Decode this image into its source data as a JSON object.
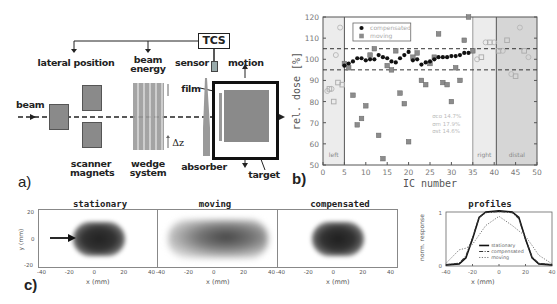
{
  "panel_a": {
    "label": "a)",
    "tcs": "TCS",
    "lateral_position": "lateral position",
    "beam_energy": [
      "beam",
      "energy"
    ],
    "sensor": "sensor",
    "motion": "motion",
    "beam": "beam",
    "film": "film",
    "delta_z": "Δz",
    "scanner_magnets": [
      "scanner",
      "magnets"
    ],
    "wedge_system": [
      "wedge",
      "system"
    ],
    "absorber": "absorber",
    "target": "target"
  },
  "chart_data": [
    {
      "panel": "b)",
      "type": "scatter",
      "title": "",
      "xlabel": "IC number",
      "ylabel": "rel. dose [%]",
      "xlim": [
        0,
        50
      ],
      "ylim": [
        50,
        120
      ],
      "xticks": [
        0,
        5,
        10,
        15,
        20,
        25,
        30,
        35,
        40,
        45,
        50
      ],
      "yticks": [
        50,
        60,
        70,
        80,
        90,
        100,
        110,
        120
      ],
      "reference_lines": [
        105,
        95
      ],
      "regions": [
        {
          "label": "left",
          "x": [
            0,
            5
          ],
          "shade": "light"
        },
        {
          "label": "right",
          "x": [
            35,
            40
          ],
          "shade": "light"
        },
        {
          "label": "distal",
          "x": [
            40.5,
            50
          ],
          "shade": "medium"
        }
      ],
      "legend": [
        "compensated",
        "moving"
      ],
      "legend_position": "upper left (inside)",
      "annotation": [
        "σco 14.7%",
        "σm 17.9%",
        "σst 14.6%"
      ],
      "series": [
        {
          "name": "compensated",
          "marker": "filled circle",
          "color": "#111111",
          "x": [
            5,
            6,
            7,
            8,
            9,
            10,
            11,
            12,
            13,
            14,
            15,
            16,
            17,
            18,
            19,
            20,
            21,
            22,
            23,
            24,
            25,
            26,
            27,
            28,
            29,
            30,
            31,
            32,
            33,
            34
          ],
          "y": [
            97,
            98,
            99,
            100.5,
            100.5,
            99.5,
            100,
            100,
            102,
            101,
            100.5,
            99,
            98.5,
            100.5,
            102,
            103.5,
            99.5,
            100,
            97.5,
            98.5,
            99,
            100,
            101,
            101,
            101,
            101.5,
            101.5,
            102,
            103,
            103
          ]
        },
        {
          "name": "moving",
          "marker": "filled square",
          "color": "#888888",
          "x": [
            5,
            6,
            7,
            8,
            9,
            10,
            11,
            12,
            13,
            14,
            15,
            16,
            17,
            18,
            19,
            20,
            21,
            22,
            23,
            24,
            25,
            26,
            27,
            28,
            29,
            30,
            31,
            32,
            33,
            34,
            35
          ],
          "y": [
            98,
            96,
            83,
            69,
            72,
            78,
            102,
            105,
            64,
            53,
            97,
            95,
            104,
            84,
            79,
            61,
            101,
            103,
            90,
            88,
            98,
            101,
            112,
            89,
            88,
            80,
            96,
            90,
            109,
            120,
            104
          ]
        },
        {
          "name": "left/right/distal (open symbols)",
          "marker": "open circle/square",
          "color": "#bbbbbb",
          "x": [
            1,
            1.5,
            2,
            2.5,
            3,
            3.5,
            4,
            4.5,
            36,
            37,
            38,
            39,
            40,
            41,
            42,
            43,
            44,
            45,
            46,
            47,
            48
          ],
          "y": [
            85,
            86,
            86,
            80,
            102,
            89,
            115,
            88,
            100,
            101,
            108,
            108,
            108,
            104,
            104,
            109,
            93,
            92,
            115,
            104,
            101
          ]
        }
      ]
    },
    {
      "panel": "c) profiles",
      "type": "line",
      "title": "profiles",
      "xlabel": "x (mm)",
      "ylabel": "norm. response",
      "xlim": [
        -40,
        40
      ],
      "ylim": [
        0,
        1
      ],
      "xticks": [
        -40,
        -20,
        0,
        20,
        40
      ],
      "yticks": [
        0,
        1
      ],
      "legend": [
        "stationary",
        "compensated",
        "moving"
      ],
      "series": [
        {
          "name": "stationary",
          "style": "solid",
          "x": [
            -40,
            -30,
            -25,
            -20,
            -15,
            -10,
            0,
            10,
            15,
            20,
            25,
            30,
            40
          ],
          "y": [
            0.02,
            0.04,
            0.15,
            0.5,
            0.9,
            1.0,
            1.02,
            1.0,
            0.9,
            0.5,
            0.15,
            0.04,
            0.02
          ]
        },
        {
          "name": "compensated",
          "style": "dash-dot",
          "x": [
            -40,
            -30,
            -25,
            -20,
            -15,
            -10,
            0,
            10,
            15,
            20,
            25,
            30,
            40
          ],
          "y": [
            0.02,
            0.05,
            0.18,
            0.52,
            0.9,
            0.99,
            1.01,
            0.99,
            0.88,
            0.5,
            0.16,
            0.05,
            0.02
          ]
        },
        {
          "name": "moving",
          "style": "dotted",
          "x": [
            -40,
            -30,
            -25,
            -20,
            -10,
            0,
            10,
            20,
            25,
            30,
            40
          ],
          "y": [
            0.05,
            0.3,
            0.33,
            0.4,
            0.75,
            0.92,
            0.75,
            0.55,
            0.38,
            0.2,
            0.04
          ]
        }
      ]
    }
  ],
  "panel_b": {
    "label": "b)",
    "ylabel": "rel. dose [%]",
    "xlabel": "IC number",
    "legend_compensated": "compensated",
    "legend_moving": "moving",
    "region_left": "left",
    "region_right": "right",
    "region_distal": "distal",
    "sigma": [
      "σco  14.7%",
      "σm  17.9%",
      "σst  14.6%"
    ],
    "yticks": [
      "120",
      "110",
      "100",
      "90",
      "80",
      "70",
      "60",
      "50"
    ],
    "xticks": [
      "0",
      "5",
      "10",
      "15",
      "20",
      "25",
      "30",
      "35",
      "40",
      "45",
      "50"
    ]
  },
  "panel_c": {
    "label": "c)",
    "titles": [
      "stationary",
      "moving",
      "compensated",
      "profiles"
    ],
    "xlabel": "x (mm)",
    "ylabel": "y (mm)",
    "ylabel_profiles": "norm. response",
    "yticks": [
      "20",
      "0",
      "-20"
    ],
    "xticks": [
      "-40",
      "-20",
      "0",
      "20",
      "40"
    ],
    "profile_yticks": [
      "1",
      "0"
    ],
    "legend": [
      "stationary",
      "compensated",
      "moving"
    ]
  }
}
